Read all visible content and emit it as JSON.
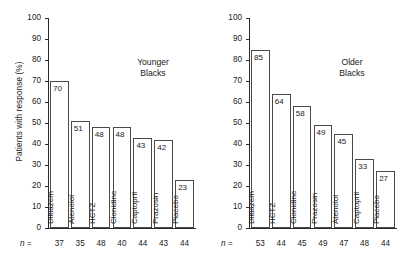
{
  "figure": {
    "ylabel": "Patients with response (%)",
    "n_prefix": "n ="
  },
  "chart_data": [
    {
      "type": "bar",
      "title": "Younger\nBlacks",
      "title_line1": "Younger",
      "title_line2": "Blacks",
      "xlabel": "",
      "ylabel": "Patients with response (%)",
      "ylim": [
        0,
        100
      ],
      "yticks": [
        0,
        10,
        20,
        30,
        40,
        50,
        60,
        70,
        80,
        90,
        100
      ],
      "grid": false,
      "legend": "none",
      "categories": [
        "Diltiazem",
        "Atenolol",
        "HCTZ",
        "Clonidine",
        "Captopril",
        "Prazosin",
        "Placebo"
      ],
      "values": [
        70,
        51,
        48,
        48,
        43,
        42,
        23
      ],
      "n": [
        37,
        35,
        48,
        40,
        44,
        43,
        44
      ]
    },
    {
      "type": "bar",
      "title": "Older\nBlacks",
      "title_line1": "Older",
      "title_line2": "Blacks",
      "xlabel": "",
      "ylabel": "",
      "ylim": [
        0,
        100
      ],
      "yticks": [
        0,
        10,
        20,
        30,
        40,
        50,
        60,
        70,
        80,
        90,
        100
      ],
      "grid": false,
      "legend": "none",
      "categories": [
        "Diltiazem",
        "HCTZ",
        "Clonidine",
        "Prazosin",
        "Atenolol",
        "Captopril",
        "Placebo"
      ],
      "values": [
        85,
        64,
        58,
        49,
        45,
        33,
        27
      ],
      "n": [
        53,
        44,
        45,
        49,
        47,
        48,
        44
      ]
    }
  ],
  "colors": {
    "bar_fill": "#ffffff",
    "bar_edge": "#4a4a4a",
    "axis": "#2b2b2b",
    "text": "#1a1a1a",
    "background": "#ffffff"
  }
}
